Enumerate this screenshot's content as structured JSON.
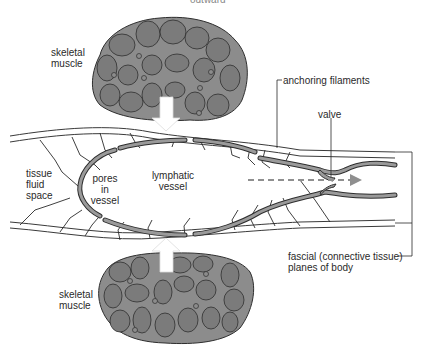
{
  "diagram": {
    "top_cut_text": "outward",
    "labels": {
      "skeletal_muscle_top": [
        "skeletal",
        "muscle"
      ],
      "skeletal_muscle_bottom": [
        "skeletal",
        "muscle"
      ],
      "anchoring_filaments": "anchoring filaments",
      "valve": "valve",
      "tissue_fluid_space": [
        "tissue",
        "fluid",
        "space"
      ],
      "pores_in_vessel": [
        "pores",
        "in",
        "vessel"
      ],
      "lymphatic_vessel": [
        "lymphatic",
        "vessel"
      ],
      "fascial_planes": [
        "fascial (connective tissue)",
        "planes of body"
      ]
    },
    "colors": {
      "muscle_fill": "#8c8c8c",
      "muscle_cell": "#7b7b7b",
      "outline": "#2e2e2e",
      "vessel_wall": "#9a9a9a",
      "flow_arrow": "#8f8f8f",
      "pressure_arrow": "#ffffff"
    }
  }
}
